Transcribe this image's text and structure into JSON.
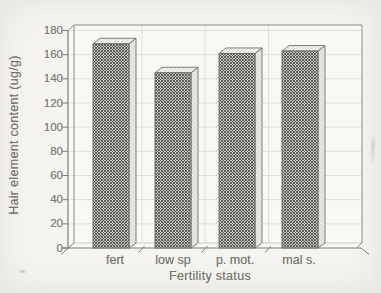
{
  "figure": {
    "background": "#f5f4f0",
    "plot_background": "#f9f8f4",
    "line_color": "#8a8a84",
    "axis_color": "#7d7d76",
    "grid_color": "#d9d8d2",
    "floor_line_color": "#c6c5bf",
    "text_color": "#75756e",
    "bar_front_base": "#c6c5bf",
    "bar_hatch_line": "#4c4c48",
    "bar_top_face": "#f0efe9",
    "bar_top_hatch": "#d7d6d0",
    "bar_side_face": "#e8e7e1",
    "bar_side_hatch": "#d2d1cb",
    "bar_edge_color": "#72726c"
  },
  "chart_data": {
    "type": "bar",
    "title": "",
    "xlabel": "Fertility status",
    "ylabel": "Hair element content (ug/g)",
    "categories": [
      "fert",
      "low sp",
      "p. mot.",
      "mal s."
    ],
    "values": [
      169,
      145,
      161,
      163
    ],
    "ylim": [
      0,
      180
    ],
    "yticks": [
      0,
      20,
      40,
      60,
      80,
      100,
      120,
      140,
      160,
      180
    ],
    "grid": "horizontal-and-category-separators",
    "legend": "none",
    "style": "grayscale scanned 3D hatched bar chart"
  }
}
